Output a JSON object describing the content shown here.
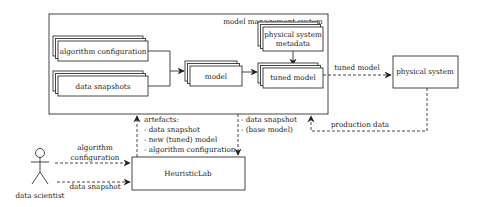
{
  "diagram": {
    "container": {
      "label": "model management system"
    },
    "nodes": {
      "algorithm_configuration": {
        "label": "algorithm configuration"
      },
      "data_snapshots": {
        "label": "data snapshots"
      },
      "model": {
        "label": "model"
      },
      "physical_system_metadata": {
        "line1": "physical system",
        "line2": "metadata"
      },
      "tuned_model": {
        "label": "tuned model"
      },
      "physical_system": {
        "label": "physical system"
      },
      "heuristiclab": {
        "label": "HeuristicLab"
      },
      "data_scientist": {
        "label": "data scientist"
      }
    },
    "edges": {
      "tuned_model_out": {
        "label": "tuned model"
      },
      "production_data": {
        "label": "production data"
      },
      "artefacts": {
        "title": "artefacts:",
        "items": [
          "- data snapshot",
          "- new (tuned) model",
          "- algorithm configuration"
        ]
      },
      "to_heuristiclab": {
        "items": [
          "- data snapshot",
          "- (base model)"
        ]
      },
      "scientist_algo": {
        "line1": "algorithm",
        "line2": "configuration"
      },
      "scientist_data": {
        "label": "data snapshot"
      }
    }
  }
}
